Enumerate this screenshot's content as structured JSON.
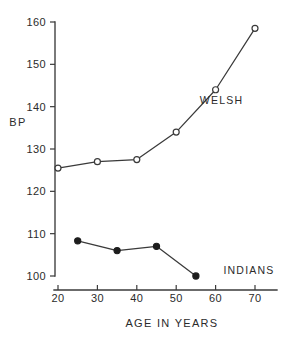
{
  "chart_data": {
    "type": "line",
    "title": "",
    "xlabel": "AGE IN YEARS",
    "ylabel": "BP",
    "xlim": [
      18,
      74
    ],
    "ylim": [
      97,
      162
    ],
    "xticks": [
      20,
      30,
      40,
      50,
      60,
      70
    ],
    "yticks": [
      100,
      110,
      120,
      130,
      140,
      150,
      160
    ],
    "xtick_labels": [
      "20",
      "30",
      "40",
      "50",
      "60",
      "70"
    ],
    "ytick_labels": [
      "100",
      "110",
      "120",
      "130",
      "140",
      "150",
      "160"
    ],
    "grid": false,
    "legend_position": "inline-annotations",
    "series": [
      {
        "name": "WELSH",
        "marker": "open-circle",
        "color": "#3a3a3a",
        "x": [
          20,
          30,
          40,
          50,
          60,
          70
        ],
        "values": [
          125.5,
          127.0,
          127.5,
          134.0,
          144.0,
          158.5
        ],
        "label_x": 56,
        "label_y": 141.5
      },
      {
        "name": "INDIANS",
        "marker": "filled-circle",
        "color": "#1d1d1d",
        "x": [
          25,
          35,
          45,
          55
        ],
        "values": [
          108.3,
          106.0,
          107.0,
          100.0
        ],
        "label_x": 62,
        "label_y": 101.5
      }
    ]
  },
  "annotations": {
    "welsh_label": "WELSH",
    "indians_label": "INDIANS",
    "y_axis_title": "BP",
    "x_axis_title": "AGE IN YEARS"
  }
}
